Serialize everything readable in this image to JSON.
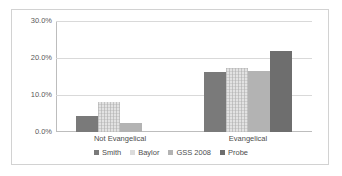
{
  "chart_data": {
    "type": "bar",
    "title": "",
    "subtitle": "",
    "xlabel": "",
    "ylabel": "",
    "categories": [
      "Not Evangelical",
      "Evangelical"
    ],
    "series": [
      {
        "name": "Smith",
        "values": [
          4.3,
          16.2
        ],
        "color": "#7a7a7a"
      },
      {
        "name": "Baylor",
        "values": [
          8.0,
          17.2
        ],
        "color": "#dcdcdc"
      },
      {
        "name": "GSS 2008",
        "values": [
          2.4,
          16.4
        ],
        "color": "#b3b3b3"
      },
      {
        "name": "Probe",
        "values": [
          0.0,
          22.0
        ],
        "color": "#6e6e6e"
      }
    ],
    "ylim": [
      0,
      30
    ],
    "yticks": [
      0,
      10,
      20,
      30
    ],
    "ytick_labels": [
      "0.0%",
      "10.0%",
      "20.0%",
      "30.0%"
    ],
    "grid": true,
    "legend_position": "bottom"
  },
  "legend": {
    "items": [
      {
        "label": "Smith"
      },
      {
        "label": "Baylor"
      },
      {
        "label": "GSS 2008"
      },
      {
        "label": "Probe"
      }
    ]
  },
  "axes": {
    "y_labels": [
      "30.0%",
      "20.0%",
      "10.0%",
      "0.0%"
    ],
    "x_labels": [
      "Not Evangelical",
      "Evangelical"
    ]
  },
  "colors": {
    "border": "#d2d2d2",
    "gridline": "#d9d9d9",
    "axis": "#bdbdbd",
    "text": "#4d4d4d"
  }
}
